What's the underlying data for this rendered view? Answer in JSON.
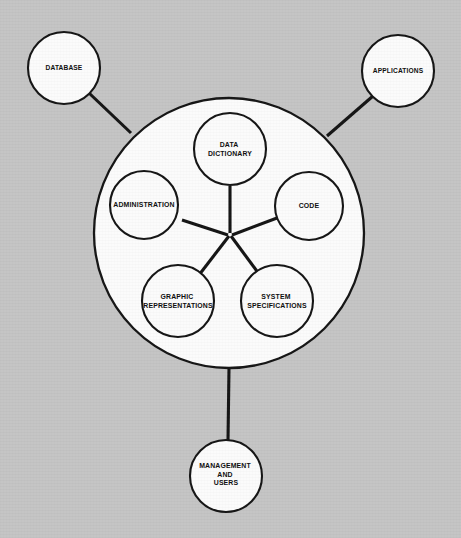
{
  "diagram": {
    "type": "hub-and-spoke concentric circle diagram",
    "background_color": "#c4c4c4",
    "node_fill_color": "#fbfbfb",
    "line_color": "#141414",
    "central_system": {
      "name": "central-system-ring",
      "label": ""
    },
    "external_nodes": [
      {
        "id": "database",
        "label": "DATABASE",
        "lines": [
          "DATABASE"
        ],
        "cx": 64,
        "cy": 68,
        "r": 36
      },
      {
        "id": "applications",
        "label": "APPLICATIONS",
        "lines": [
          "APPLICATIONS"
        ],
        "cx": 398,
        "cy": 71,
        "r": 36
      },
      {
        "id": "management-and-users",
        "label": "MANAGEMENT AND USERS",
        "lines": [
          "MANAGEMENT",
          "AND",
          "USERS"
        ],
        "cx": 226,
        "cy": 476,
        "r": 36
      }
    ],
    "inner_nodes": [
      {
        "id": "data-dictionary",
        "label": "DATA DICTIONARY",
        "lines": [
          "DATA",
          "DICTIONARY"
        ],
        "cx": 230,
        "cy": 149,
        "r": 36
      },
      {
        "id": "code",
        "label": "CODE",
        "lines": [
          "CODE"
        ],
        "cx": 309,
        "cy": 206,
        "r": 34
      },
      {
        "id": "system-specifications",
        "label": "SYSTEM SPECIFICATIONS",
        "lines": [
          "SYSTEM",
          "SPECIFICATIONS"
        ],
        "cx": 277,
        "cy": 301,
        "r": 36
      },
      {
        "id": "graphic-representations",
        "label": "GRAPHIC REPRESENTATIONS",
        "lines": [
          "GRAPHIC",
          "REPRESENTATIONS"
        ],
        "cx": 178,
        "cy": 301,
        "r": 36
      },
      {
        "id": "administration",
        "label": "ADMINISTRATION",
        "lines": [
          "ADMINISTRATION"
        ],
        "cx": 144,
        "cy": 205,
        "r": 34
      }
    ],
    "outer_ring": {
      "id": "system-boundary",
      "cx": 229,
      "cy": 233,
      "r": 135
    },
    "hub": {
      "cx": 230,
      "cy": 233
    },
    "connectors": [
      {
        "id": "database-to-system",
        "from": "database",
        "to": "system-boundary"
      },
      {
        "id": "applications-to-system",
        "from": "applications",
        "to": "system-boundary"
      },
      {
        "id": "management-to-system",
        "from": "management-and-users",
        "to": "system-boundary"
      }
    ],
    "spokes": [
      {
        "id": "spoke-data-dictionary",
        "to": "data-dictionary"
      },
      {
        "id": "spoke-code",
        "to": "code"
      },
      {
        "id": "spoke-system-specifications",
        "to": "system-specifications"
      },
      {
        "id": "spoke-graphic-representations",
        "to": "graphic-representations"
      },
      {
        "id": "spoke-administration",
        "to": "administration"
      }
    ]
  }
}
